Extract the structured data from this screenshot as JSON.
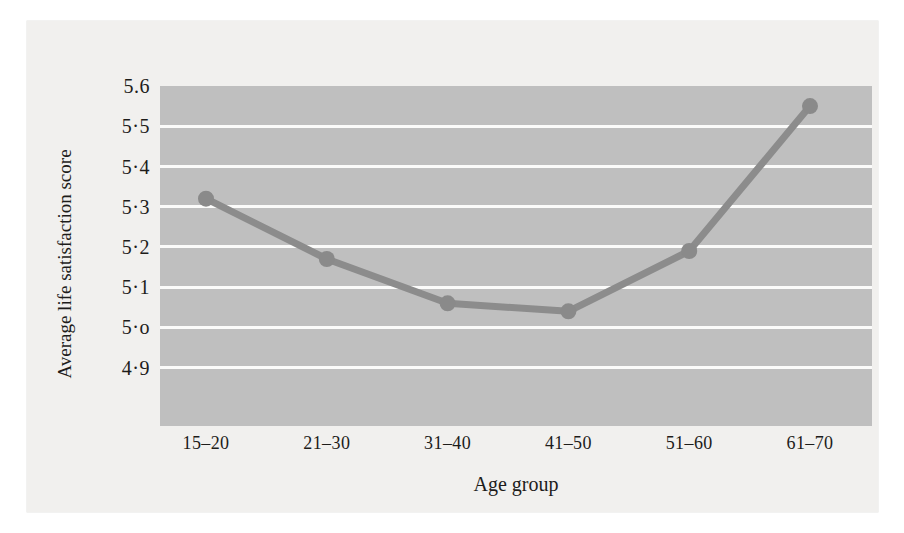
{
  "chart_data": {
    "type": "line",
    "title": "",
    "xlabel": "Age group",
    "ylabel": "Average life satisfaction score",
    "categories": [
      "15–20",
      "21–30",
      "31–40",
      "41–50",
      "51–60",
      "61–70"
    ],
    "values": [
      5.32,
      5.17,
      5.06,
      5.04,
      5.19,
      5.55
    ],
    "series": [
      {
        "name": "Average life satisfaction score",
        "values": [
          5.32,
          5.17,
          5.06,
          5.04,
          5.19,
          5.55
        ]
      }
    ],
    "ylim": [
      4.755,
      5.6
    ],
    "yticks": [
      5.6,
      5.5,
      5.4,
      5.3,
      5.2,
      5.1,
      5.0,
      4.9
    ],
    "ytick_labels": [
      "5.6",
      "5·5",
      "5·4",
      "5·3",
      "5·2",
      "5·1",
      "5·o",
      "4·9"
    ],
    "grid": true,
    "legend": "none",
    "colors": {
      "plot_background": "#bfbfbf",
      "gridline": "#fbfbfa",
      "series_line": "#8c8c8c",
      "marker": "#8a8a8a",
      "page_background": "#f1f0ee",
      "text": "#1d1c1a"
    }
  }
}
